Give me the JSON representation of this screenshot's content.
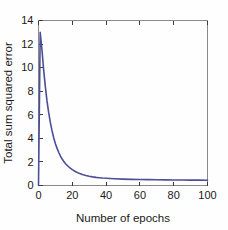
{
  "chart_data": {
    "type": "line",
    "title": "",
    "xlabel": "Number of epochs",
    "ylabel": "Total sum squared error",
    "xlim": [
      0,
      100
    ],
    "ylim": [
      0,
      14
    ],
    "xticks": [
      0,
      20,
      40,
      60,
      80,
      100
    ],
    "yticks": [
      0,
      2,
      4,
      6,
      8,
      10,
      12,
      14
    ],
    "xtick_labels": [
      "0",
      "20",
      "40",
      "60",
      "80",
      "100"
    ],
    "ytick_labels": [
      "0",
      "2",
      "4",
      "6",
      "8",
      "10",
      "12",
      "14"
    ],
    "grid": false,
    "legend": "none",
    "series": [
      {
        "name": "Total sum squared error",
        "color": "#4b4f96",
        "x": [
          0,
          1,
          2,
          3,
          4,
          5,
          6,
          7,
          8,
          9,
          10,
          11,
          12,
          13,
          14,
          15,
          16,
          17,
          18,
          19,
          20,
          22,
          24,
          26,
          28,
          30,
          32,
          34,
          36,
          38,
          40,
          45,
          50,
          55,
          60,
          65,
          70,
          75,
          80,
          85,
          90,
          95,
          100
        ],
        "y": [
          0.0,
          13.0,
          11.6,
          9.9,
          8.45,
          7.2,
          6.2,
          5.35,
          4.65,
          4.05,
          3.55,
          3.15,
          2.8,
          2.5,
          2.25,
          2.03,
          1.85,
          1.7,
          1.57,
          1.45,
          1.35,
          1.17,
          1.03,
          0.93,
          0.85,
          0.78,
          0.73,
          0.69,
          0.66,
          0.63,
          0.61,
          0.57,
          0.54,
          0.52,
          0.51,
          0.5,
          0.49,
          0.48,
          0.47,
          0.47,
          0.46,
          0.46,
          0.45
        ]
      }
    ],
    "colors": {
      "curve": "#4b4f96",
      "axis": "#8a8a8a",
      "text": "#1a1a1a",
      "background": "#fefefe"
    },
    "annotations": {
      "initial_error": 13.0,
      "final_error": 0.45,
      "description": "Exponentially decaying training error versus training epochs"
    }
  }
}
